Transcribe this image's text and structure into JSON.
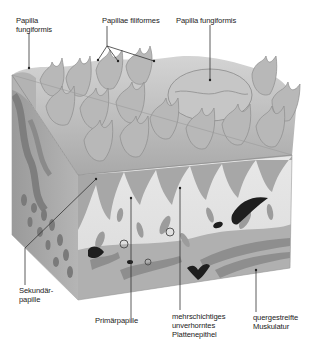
{
  "figure": {
    "labels": {
      "papilla_fungiformis_left": "Papilla\nfungiformis",
      "papillae_filiformes": "Papillae filiformes",
      "papilla_fungiformis_right": "Papilla fungiformis",
      "sekundaerpapille": "Sekundär-\npapille",
      "primaerpapille": "Primärpapille",
      "plattenepithel": "mehrschichtiges\nunverhorntes\nPlattenepithel",
      "muskulatur": "quergestreifte\nMuskulatur"
    },
    "colors": {
      "background": "#ffffff",
      "surface": "#b9b9b9",
      "surface_highlight": "#d6d6d6",
      "surface_shadow": "#8f8f8f",
      "epithelium": "#e4e4e4",
      "connective_tissue": "#a2a2a2",
      "vessel": "#1e1e1e",
      "leader_line": "#333333",
      "text": "#222222"
    }
  }
}
